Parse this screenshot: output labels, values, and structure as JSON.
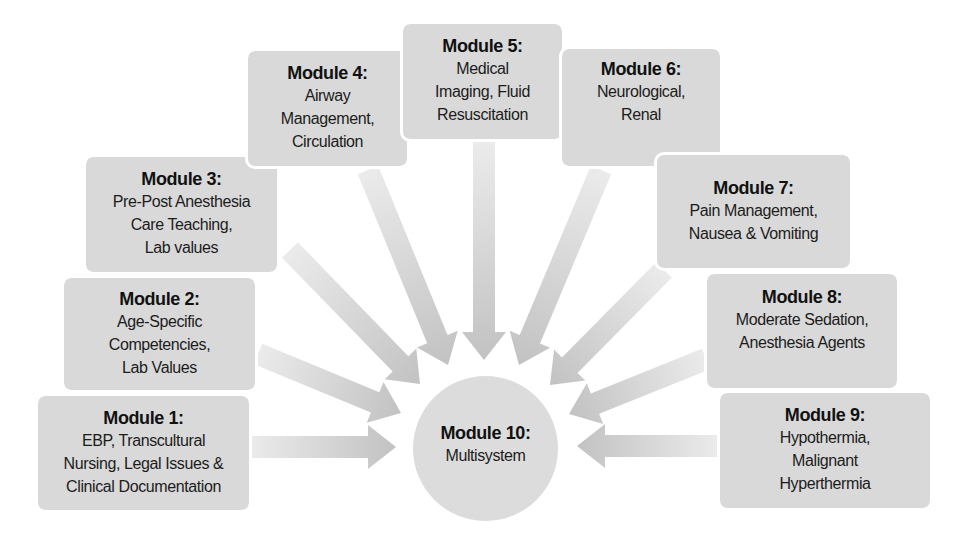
{
  "diagram": {
    "type": "hub-and-spoke",
    "colors": {
      "box_fill": "#d9d9d9",
      "hub_fill": "#dcdcdc",
      "arrow_light": "#ebebeb",
      "arrow_dark": "#c2c2c2",
      "text": "#1a1a1a"
    },
    "modules": [
      {
        "id": "m1",
        "title": "Module 1:",
        "body": "EBP, Transcultural\nNursing, Legal Issues &\nClinical Documentation"
      },
      {
        "id": "m2",
        "title": "Module 2:",
        "body": "Age-Specific\nCompetencies,\nLab Values"
      },
      {
        "id": "m3",
        "title": "Module 3:",
        "body": "Pre-Post Anesthesia\nCare Teaching,\nLab values"
      },
      {
        "id": "m4",
        "title": "Module 4:",
        "body": "Airway\nManagement,\nCirculation"
      },
      {
        "id": "m5",
        "title": "Module 5:",
        "body": "Medical\nImaging, Fluid\nResuscitation"
      },
      {
        "id": "m6",
        "title": "Module 6:",
        "body": "Neurological,\nRenal"
      },
      {
        "id": "m7",
        "title": "Module 7:",
        "body": "Pain Management,\nNausea & Vomiting"
      },
      {
        "id": "m8",
        "title": "Module 8:",
        "body": "Moderate Sedation,\nAnesthesia Agents"
      },
      {
        "id": "m9",
        "title": "Module 9:",
        "body": "Hypothermia,\nMalignant\nHyperthermia"
      }
    ],
    "hub": {
      "id": "m10",
      "title": "Module 10:",
      "body": "Multisystem"
    },
    "edges": [
      {
        "from": "m1",
        "to": "m10"
      },
      {
        "from": "m2",
        "to": "m10"
      },
      {
        "from": "m3",
        "to": "m10"
      },
      {
        "from": "m4",
        "to": "m10"
      },
      {
        "from": "m5",
        "to": "m10"
      },
      {
        "from": "m6",
        "to": "m10"
      },
      {
        "from": "m7",
        "to": "m10"
      },
      {
        "from": "m8",
        "to": "m10"
      },
      {
        "from": "m9",
        "to": "m10"
      }
    ]
  }
}
